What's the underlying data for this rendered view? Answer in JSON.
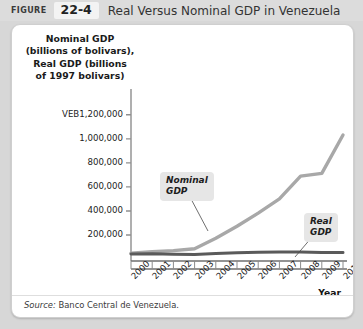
{
  "header": {
    "figure_label": "FIGURE",
    "figure_number": "22-4",
    "title": "Real Versus Nominal GDP in Venezuela"
  },
  "panel": {
    "y_axis_title_lines": [
      "Nominal GDP",
      "(billions of bolivars),",
      "Real GDP (billions",
      "of 1997 bolivars)"
    ],
    "source_label": "Source:",
    "source_text": " Banco Central de Venezuela."
  },
  "annotations": {
    "nominal": {
      "line1": "Nominal",
      "line2": "GDP"
    },
    "real": {
      "line1": "Real",
      "line2": "GDP"
    }
  },
  "chart_data": {
    "type": "line",
    "title": "Real Versus Nominal GDP in Venezuela",
    "xlabel": "Year",
    "ylabel": "Nominal GDP (billions of bolivars), Real GDP (billions of 1997 bolivars)",
    "currency_prefix": "VEB",
    "categories": [
      "2000",
      "2001",
      "2002",
      "2003",
      "2004",
      "2005",
      "2006",
      "2007",
      "2008",
      "2009",
      "2010"
    ],
    "ytick_labels": [
      "VEB1,200,000",
      "1,000,000",
      "800,000",
      "600,000",
      "400,000",
      "200,000"
    ],
    "ytick_values": [
      1200000,
      1000000,
      800000,
      600000,
      400000,
      200000
    ],
    "ylim": [
      0,
      1290000
    ],
    "grid": false,
    "legend": "annotations",
    "series": [
      {
        "name": "Nominal GDP",
        "color": "#a8a8a8",
        "values": [
          48000,
          60000,
          70000,
          86000,
          172000,
          272000,
          382000,
          500000,
          690000,
          712000,
          1032000
        ]
      },
      {
        "name": "Real GDP",
        "color": "#5a5a5a",
        "values": [
          42000,
          44000,
          40000,
          38000,
          46000,
          52000,
          56000,
          58000,
          58000,
          54000,
          55000
        ]
      }
    ]
  }
}
